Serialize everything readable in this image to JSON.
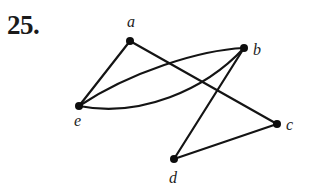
{
  "problem": {
    "number_label": "25."
  },
  "graph": {
    "vertices": [
      {
        "id": "a",
        "label": "a",
        "x": 130,
        "y": 41,
        "label_x": 127,
        "label_y": 27
      },
      {
        "id": "b",
        "label": "b",
        "x": 244,
        "y": 48,
        "label_x": 253,
        "label_y": 55
      },
      {
        "id": "c",
        "label": "c",
        "x": 277,
        "y": 124,
        "label_x": 286,
        "label_y": 130
      },
      {
        "id": "d",
        "label": "d",
        "x": 174,
        "y": 159,
        "label_x": 169,
        "label_y": 183
      },
      {
        "id": "e",
        "label": "e",
        "x": 79,
        "y": 106,
        "label_x": 74,
        "label_y": 126
      }
    ],
    "edges": [
      {
        "from": "a",
        "to": "e",
        "type": "straight"
      },
      {
        "from": "a",
        "to": "c",
        "type": "straight"
      },
      {
        "from": "e",
        "to": "b",
        "type": "curved-upper"
      },
      {
        "from": "e",
        "to": "b",
        "type": "curved-lower"
      },
      {
        "from": "b",
        "to": "d",
        "type": "straight"
      },
      {
        "from": "d",
        "to": "c",
        "type": "straight"
      }
    ],
    "colors": {
      "edge": "#141414",
      "vertex": "#0d0d0d",
      "label": "#222222"
    }
  }
}
